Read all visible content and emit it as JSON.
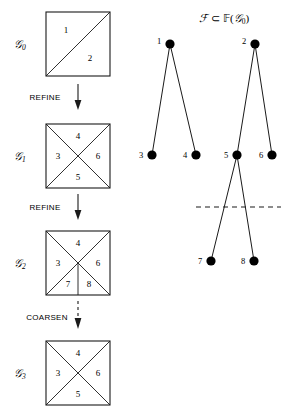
{
  "figure": {
    "title_formula": {
      "full": "F ⊂ F(G0)",
      "script_f": "ℱ",
      "subset": "⊂",
      "bb_f": "𝔽",
      "open_paren": "(",
      "script_g": "𝒢",
      "g_sub": "0",
      "close_paren": ")"
    },
    "meshes": [
      {
        "id": "G0",
        "label_base": "𝒢",
        "label_sub": "0",
        "subdivision": "single-diagonal",
        "regions": [
          {
            "num": "1",
            "x": 66,
            "y": 30
          },
          {
            "num": "2",
            "x": 90,
            "y": 58
          }
        ]
      },
      {
        "id": "G1",
        "label_base": "𝒢",
        "label_sub": "1",
        "subdivision": "both-diagonals",
        "regions": [
          {
            "num": "4",
            "x": 78,
            "y": 136
          },
          {
            "num": "3",
            "x": 58,
            "y": 156
          },
          {
            "num": "6",
            "x": 98,
            "y": 156
          },
          {
            "num": "5",
            "x": 78,
            "y": 176
          }
        ]
      },
      {
        "id": "G2",
        "label_base": "𝒢",
        "label_sub": "2",
        "subdivision": "both-diagonals-plus-vertical",
        "regions": [
          {
            "num": "4",
            "x": 78,
            "y": 243
          },
          {
            "num": "3",
            "x": 58,
            "y": 263
          },
          {
            "num": "6",
            "x": 98,
            "y": 263
          },
          {
            "num": "7",
            "x": 68,
            "y": 283
          },
          {
            "num": "8",
            "x": 89,
            "y": 283
          }
        ]
      },
      {
        "id": "G3",
        "label_base": "𝒢",
        "label_sub": "3",
        "subdivision": "both-diagonals",
        "regions": [
          {
            "num": "4",
            "x": 78,
            "y": 353
          },
          {
            "num": "3",
            "x": 58,
            "y": 373
          },
          {
            "num": "6",
            "x": 98,
            "y": 373
          },
          {
            "num": "5",
            "x": 78,
            "y": 393
          }
        ]
      }
    ],
    "operations": [
      {
        "label": "REFINE",
        "arrow": "solid",
        "x": 45,
        "y": 98
      },
      {
        "label": "REFINE",
        "arrow": "solid",
        "x": 45,
        "y": 208
      },
      {
        "label": "COARSEN",
        "arrow": "dashed",
        "x": 45,
        "y": 318
      }
    ],
    "tree": {
      "nodes": [
        {
          "num": "1",
          "x": 170,
          "y": 44,
          "label_x": 159,
          "label_y": 41
        },
        {
          "num": "2",
          "x": 255,
          "y": 44,
          "label_x": 244,
          "label_y": 41
        },
        {
          "num": "3",
          "x": 152,
          "y": 155,
          "label_x": 141,
          "label_y": 152
        },
        {
          "num": "4",
          "x": 196,
          "y": 155,
          "label_x": 185,
          "label_y": 152
        },
        {
          "num": "5",
          "x": 237,
          "y": 155,
          "label_x": 226,
          "label_y": 152
        },
        {
          "num": "6",
          "x": 272,
          "y": 155,
          "label_x": 261,
          "label_y": 152
        },
        {
          "num": "7",
          "x": 211,
          "y": 261,
          "label_x": 200,
          "label_y": 258
        },
        {
          "num": "8",
          "x": 254,
          "y": 261,
          "label_x": 243,
          "label_y": 258
        }
      ],
      "edges": [
        {
          "from": "1",
          "to": "3"
        },
        {
          "from": "1",
          "to": "4"
        },
        {
          "from": "2",
          "to": "5"
        },
        {
          "from": "2",
          "to": "6"
        },
        {
          "from": "5",
          "to": "7"
        },
        {
          "from": "5",
          "to": "8"
        }
      ],
      "cut_line": {
        "x1": 196,
        "x2": 281,
        "y": 207
      }
    },
    "colors": {
      "ink": "#1a1a1a",
      "node_fill": "#000000",
      "background": "#ffffff"
    }
  }
}
